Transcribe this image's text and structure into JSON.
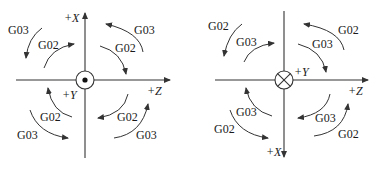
{
  "diagrams": [
    {
      "name": "left",
      "axes": {
        "vertical": "+X",
        "horizontal": "+Z",
        "center": "+Y"
      },
      "center_symbol": "dot-in-circle",
      "labels": {
        "tl_outer": "G03",
        "tl_inner": "G02",
        "tr_outer": "G03",
        "tr_inner": "G02",
        "bl_inner": "G02",
        "bl_outer": "G03",
        "br_inner": "G02",
        "br_outer": "G03"
      }
    },
    {
      "name": "right",
      "axes": {
        "vertical": "+X",
        "horizontal": "+Z",
        "center": "+Y"
      },
      "center_symbol": "cross-in-circle",
      "labels": {
        "tl_outer": "G02",
        "tl_inner": "G03",
        "tr_outer": "G02",
        "tr_inner": "G03",
        "bl_inner": "G03",
        "bl_outer": "G02",
        "br_inner": "G03",
        "br_outer": "G02"
      }
    }
  ],
  "colors": {
    "stroke": "#333333",
    "text": "#1a1a1a",
    "background": "#ffffff"
  }
}
